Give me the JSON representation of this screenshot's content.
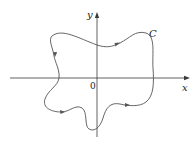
{
  "diagram": {
    "type": "closed plane curve with coordinate axes",
    "labels": {
      "x_axis": "x",
      "y_axis": "y",
      "origin": "0",
      "curve": "C"
    },
    "curve_orientation": "counterclockwise (arrows along curve)",
    "colors": {
      "axis": "#3a3a3a",
      "curve": "#555555",
      "background": "#ffffff"
    }
  }
}
